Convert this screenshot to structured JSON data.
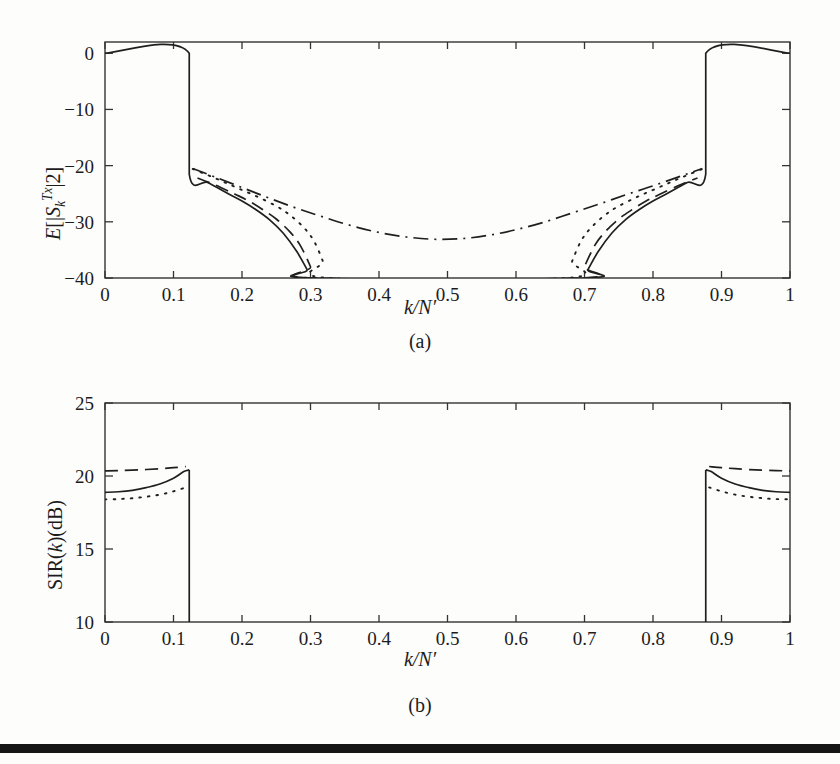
{
  "figure": {
    "background_color": "#fdfdfc",
    "ink_color": "#1f1f1f"
  },
  "panel_a": {
    "caption": "(a)",
    "xlabel_k": "k",
    "xlabel_slash": "/",
    "xlabel_n": "N",
    "xlabel_prime": "′",
    "ylabel_e": "E",
    "ylabel_open": "[|",
    "ylabel_s": "S",
    "ylabel_sub": "k",
    "ylabel_sup": "Tx",
    "ylabel_close": "|2]"
  },
  "panel_b": {
    "caption": "(b)",
    "xlabel_k": "k",
    "xlabel_slash": "/",
    "xlabel_n": "N",
    "xlabel_prime": "′",
    "ylabel_sir": "SIR(",
    "ylabel_k": "k",
    "ylabel_db": ")(dB)"
  },
  "chart_data": [
    {
      "id": "panel-a",
      "type": "line",
      "title": "",
      "xlabel": "k/N'",
      "ylabel": "E[|S_k^{Tx}|2]",
      "xlim": [
        0,
        1
      ],
      "ylim": [
        -40,
        2
      ],
      "xticks": [
        0,
        0.1,
        0.2,
        0.3,
        0.4,
        0.5,
        0.6,
        0.7,
        0.8,
        0.9,
        1
      ],
      "xticklabels": [
        "0",
        "0.1",
        "0.2",
        "0.3",
        "0.4",
        "0.5",
        "0.6",
        "0.7",
        "0.8",
        "0.9",
        "1"
      ],
      "yticks": [
        0,
        -10,
        -20,
        -30,
        -40
      ],
      "yticklabels": [
        "0",
        "−10",
        "−20",
        "−30",
        "−40"
      ],
      "grid": false,
      "legend": "none",
      "passband_edges": [
        0.123,
        0.877
      ],
      "passband_level_db": 0,
      "series": [
        {
          "name": "solid",
          "style": "solid",
          "points": [
            [
              0.0,
              0.0
            ],
            [
              0.123,
              0.0
            ],
            [
              0.123,
              -21.5
            ],
            [
              0.15,
              -23.0
            ],
            [
              0.18,
              -25.0
            ],
            [
              0.2,
              -26.3
            ],
            [
              0.22,
              -27.8
            ],
            [
              0.24,
              -29.6
            ],
            [
              0.26,
              -32.0
            ],
            [
              0.28,
              -35.3
            ],
            [
              0.295,
              -38.5
            ],
            [
              0.302,
              -40.0
            ],
            [
              0.698,
              -40.0
            ],
            [
              0.705,
              -38.5
            ],
            [
              0.72,
              -35.3
            ],
            [
              0.74,
              -32.0
            ],
            [
              0.76,
              -29.6
            ],
            [
              0.78,
              -27.8
            ],
            [
              0.8,
              -26.3
            ],
            [
              0.82,
              -25.0
            ],
            [
              0.85,
              -23.0
            ],
            [
              0.877,
              -21.5
            ],
            [
              0.877,
              0.0
            ],
            [
              1.0,
              0.0
            ]
          ]
        },
        {
          "name": "dashed",
          "style": "dashed",
          "points": [
            [
              0.135,
              -22.2
            ],
            [
              0.16,
              -23.4
            ],
            [
              0.19,
              -25.1
            ],
            [
              0.21,
              -26.3
            ],
            [
              0.23,
              -27.8
            ],
            [
              0.25,
              -29.5
            ],
            [
              0.27,
              -31.8
            ],
            [
              0.285,
              -34.2
            ],
            [
              0.3,
              -38.0
            ],
            [
              0.305,
              -40.0
            ],
            [
              0.695,
              -40.0
            ],
            [
              0.7,
              -38.0
            ],
            [
              0.715,
              -34.2
            ],
            [
              0.73,
              -31.8
            ],
            [
              0.75,
              -29.5
            ],
            [
              0.77,
              -27.8
            ],
            [
              0.79,
              -26.3
            ],
            [
              0.81,
              -25.1
            ],
            [
              0.84,
              -23.4
            ],
            [
              0.865,
              -22.2
            ]
          ]
        },
        {
          "name": "dotted",
          "style": "dotted",
          "points": [
            [
              0.128,
              -20.6
            ],
            [
              0.16,
              -22.2
            ],
            [
              0.19,
              -23.8
            ],
            [
              0.22,
              -25.4
            ],
            [
              0.25,
              -27.2
            ],
            [
              0.27,
              -28.8
            ],
            [
              0.29,
              -31.0
            ],
            [
              0.305,
              -33.4
            ],
            [
              0.318,
              -37.0
            ],
            [
              0.326,
              -40.0
            ],
            [
              0.674,
              -40.0
            ],
            [
              0.682,
              -37.0
            ],
            [
              0.695,
              -33.4
            ],
            [
              0.71,
              -31.0
            ],
            [
              0.73,
              -28.8
            ],
            [
              0.75,
              -27.2
            ],
            [
              0.78,
              -25.4
            ],
            [
              0.81,
              -23.8
            ],
            [
              0.84,
              -22.2
            ],
            [
              0.872,
              -20.6
            ]
          ]
        },
        {
          "name": "dash-dot",
          "style": "dashdot",
          "points": [
            [
              0.128,
              -20.5
            ],
            [
              0.16,
              -22.0
            ],
            [
              0.2,
              -23.9
            ],
            [
              0.24,
              -25.8
            ],
            [
              0.28,
              -27.6
            ],
            [
              0.32,
              -29.2
            ],
            [
              0.36,
              -30.7
            ],
            [
              0.4,
              -31.9
            ],
            [
              0.44,
              -32.7
            ],
            [
              0.48,
              -33.1
            ],
            [
              0.52,
              -33.0
            ],
            [
              0.56,
              -32.4
            ],
            [
              0.6,
              -31.4
            ],
            [
              0.64,
              -30.1
            ],
            [
              0.68,
              -28.5
            ],
            [
              0.72,
              -26.9
            ],
            [
              0.76,
              -25.2
            ],
            [
              0.8,
              -23.6
            ],
            [
              0.84,
              -21.9
            ],
            [
              0.872,
              -20.5
            ]
          ]
        }
      ]
    },
    {
      "id": "panel-b",
      "type": "line",
      "title": "",
      "xlabel": "k/N'",
      "ylabel": "SIR(k)(dB)",
      "xlim": [
        0,
        1
      ],
      "ylim": [
        10,
        25
      ],
      "xticks": [
        0,
        0.1,
        0.2,
        0.3,
        0.4,
        0.5,
        0.6,
        0.7,
        0.8,
        0.9,
        1
      ],
      "xticklabels": [
        "0",
        "0.1",
        "0.2",
        "0.3",
        "0.4",
        "0.5",
        "0.6",
        "0.7",
        "0.8",
        "0.9",
        "1"
      ],
      "yticks": [
        10,
        15,
        20,
        25
      ],
      "yticklabels": [
        "10",
        "15",
        "20",
        "25"
      ],
      "grid": false,
      "legend": "none",
      "passband_edges": [
        0.123,
        0.877
      ],
      "series": [
        {
          "name": "dashed",
          "style": "dashed",
          "points": [
            [
              0.0,
              20.35
            ],
            [
              0.02,
              20.37
            ],
            [
              0.05,
              20.42
            ],
            [
              0.08,
              20.5
            ],
            [
              0.1,
              20.57
            ],
            [
              0.118,
              20.65
            ]
          ]
        },
        {
          "name": "dashed-right",
          "style": "dashed",
          "points": [
            [
              0.882,
              20.65
            ],
            [
              0.9,
              20.57
            ],
            [
              0.92,
              20.5
            ],
            [
              0.95,
              20.42
            ],
            [
              0.98,
              20.37
            ],
            [
              1.0,
              20.35
            ]
          ]
        },
        {
          "name": "solid",
          "style": "solid",
          "points": [
            [
              0.0,
              18.88
            ],
            [
              0.02,
              18.92
            ],
            [
              0.04,
              19.02
            ],
            [
              0.06,
              19.2
            ],
            [
              0.08,
              19.45
            ],
            [
              0.1,
              19.85
            ],
            [
              0.115,
              20.3
            ],
            [
              0.123,
              20.42
            ]
          ]
        },
        {
          "name": "solid-right",
          "style": "solid",
          "points": [
            [
              0.877,
              20.42
            ],
            [
              0.885,
              20.3
            ],
            [
              0.9,
              19.85
            ],
            [
              0.92,
              19.45
            ],
            [
              0.94,
              19.2
            ],
            [
              0.96,
              19.02
            ],
            [
              0.98,
              18.92
            ],
            [
              1.0,
              18.88
            ]
          ]
        },
        {
          "name": "dotted",
          "style": "dotted",
          "points": [
            [
              0.0,
              18.4
            ],
            [
              0.02,
              18.42
            ],
            [
              0.04,
              18.48
            ],
            [
              0.06,
              18.58
            ],
            [
              0.08,
              18.72
            ],
            [
              0.1,
              18.95
            ],
            [
              0.118,
              19.22
            ]
          ]
        },
        {
          "name": "dotted-right",
          "style": "dotted",
          "points": [
            [
              0.882,
              19.22
            ],
            [
              0.9,
              18.95
            ],
            [
              0.92,
              18.72
            ],
            [
              0.94,
              18.58
            ],
            [
              0.96,
              18.48
            ],
            [
              0.98,
              18.42
            ],
            [
              1.0,
              18.4
            ]
          ]
        },
        {
          "name": "band-edge-left",
          "style": "solid-vertical",
          "points": [
            [
              0.123,
              20.42
            ],
            [
              0.123,
              10.0
            ]
          ]
        },
        {
          "name": "band-edge-right",
          "style": "solid-vertical",
          "points": [
            [
              0.877,
              20.42
            ],
            [
              0.877,
              10.0
            ]
          ]
        }
      ]
    }
  ]
}
